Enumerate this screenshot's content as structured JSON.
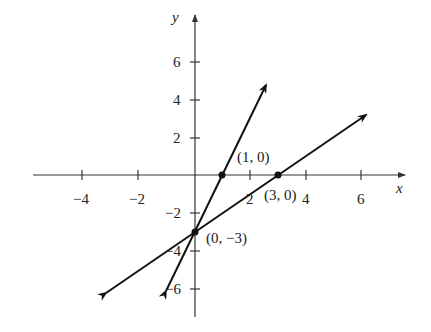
{
  "axes": {
    "x_label": "x",
    "y_label": "y",
    "x_ticks": [
      {
        "value": -4,
        "label": "−4"
      },
      {
        "value": -2,
        "label": "−2"
      },
      {
        "value": 2,
        "label": "2"
      },
      {
        "value": 4,
        "label": "4"
      },
      {
        "value": 6,
        "label": "6"
      }
    ],
    "y_ticks": [
      {
        "value": 6,
        "label": "6"
      },
      {
        "value": 4,
        "label": "4"
      },
      {
        "value": 2,
        "label": "2"
      },
      {
        "value": -2,
        "label": "−2"
      },
      {
        "value": -4,
        "label": "−4"
      },
      {
        "value": -6,
        "label": "−6"
      }
    ]
  },
  "points": [
    {
      "label": "(1, 0)",
      "x": 1,
      "y": 0
    },
    {
      "label": "(3, 0)",
      "x": 3,
      "y": 0
    },
    {
      "label": "(0, −3)",
      "x": 0,
      "y": -3
    }
  ],
  "lines": [
    {
      "name": "steep-line",
      "slope": 3,
      "intercept": -3,
      "through": [
        "(0,-3)",
        "(1,0)"
      ]
    },
    {
      "name": "shallow-line",
      "slope": 1,
      "intercept": -3,
      "through": [
        "(0,-3)",
        "(3,0)"
      ]
    }
  ],
  "colors": {
    "ink": "#111111",
    "background": "#ffffff"
  }
}
